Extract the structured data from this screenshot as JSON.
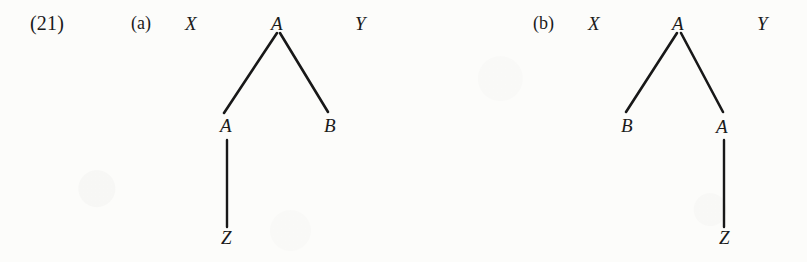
{
  "page": {
    "example_number": "(21)",
    "background_color": "#fcfcfa",
    "ink_color": "#181818"
  },
  "diagrams": [
    {
      "id": "a",
      "label": "(a)",
      "left_bracket": "X",
      "right_bracket": "Y",
      "nodes": [
        {
          "name": "root",
          "text": "A",
          "x": 278,
          "y": 24
        },
        {
          "name": "left-child",
          "text": "A",
          "x": 227,
          "y": 125
        },
        {
          "name": "right-child",
          "text": "B",
          "x": 331,
          "y": 125
        },
        {
          "name": "leaf",
          "text": "Z",
          "x": 228,
          "y": 237
        }
      ],
      "edges": [
        {
          "name": "root-to-left-child",
          "x1": 277,
          "y1": 33,
          "x2": 224,
          "y2": 113
        },
        {
          "name": "root-to-right-child",
          "x1": 280,
          "y1": 33,
          "x2": 328,
          "y2": 112
        },
        {
          "name": "left-child-to-leaf",
          "x1": 227,
          "y1": 140,
          "x2": 227,
          "y2": 227
        }
      ],
      "bracket_positions": {
        "left_x": 191,
        "right_x": 361,
        "y": 24
      },
      "label_position": {
        "x": 143,
        "y": 24
      }
    },
    {
      "id": "b",
      "label": "(b)",
      "left_bracket": "X",
      "right_bracket": "Y",
      "nodes": [
        {
          "name": "root",
          "text": "A",
          "x": 679,
          "y": 24
        },
        {
          "name": "left-child",
          "text": "B",
          "x": 628,
          "y": 125
        },
        {
          "name": "right-child",
          "text": "A",
          "x": 723,
          "y": 126
        },
        {
          "name": "leaf",
          "text": "Z",
          "x": 726,
          "y": 237
        }
      ],
      "edges": [
        {
          "name": "root-to-left-child",
          "x1": 677,
          "y1": 33,
          "x2": 626,
          "y2": 112
        },
        {
          "name": "root-to-right-child",
          "x1": 681,
          "y1": 33,
          "x2": 723,
          "y2": 112
        },
        {
          "name": "right-child-to-leaf",
          "x1": 724,
          "y1": 140,
          "x2": 724,
          "y2": 227
        }
      ],
      "bracket_positions": {
        "left_x": 594,
        "right_x": 763,
        "y": 24
      },
      "label_position": {
        "x": 545,
        "y": 24
      }
    }
  ]
}
